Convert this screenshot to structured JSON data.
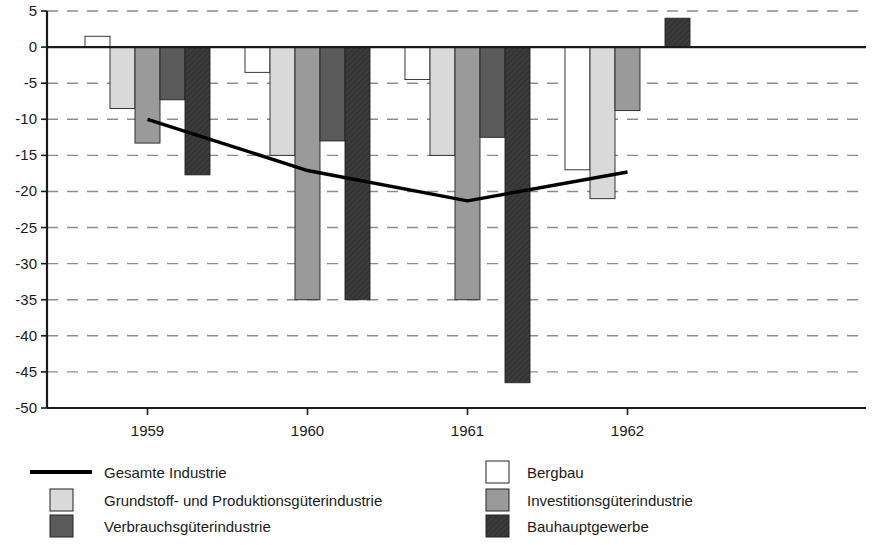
{
  "chart_data": {
    "type": "bar",
    "title": "",
    "xlabel": "",
    "ylabel": "",
    "categories": [
      "1959",
      "1960",
      "1961",
      "1962"
    ],
    "ylim": [
      -50,
      5
    ],
    "yticks": [
      5,
      0,
      -5,
      -10,
      -15,
      -20,
      -25,
      -30,
      -35,
      -40,
      -45,
      -50
    ],
    "ytick_labels": [
      "5",
      "0",
      "-5",
      "-10",
      "-15",
      "-20",
      "-25",
      "-30",
      "-35",
      "-40",
      "-45",
      "-50"
    ],
    "grid": true,
    "grid_style": "dashed",
    "legend_position": "bottom",
    "series": [
      {
        "name": "Bergbau",
        "kind": "bar",
        "color": "#ffffff",
        "stroke": "#222222",
        "values": [
          1.5,
          -3.5,
          -4.5,
          -17.0
        ]
      },
      {
        "name": "Grundstoff- und Produktionsgüterindustrie",
        "kind": "bar",
        "color": "#d9d9d9",
        "stroke": "#222222",
        "values": [
          -8.5,
          -15.0,
          -15.0,
          -21.0
        ]
      },
      {
        "name": "Investitionsgüterindustrie",
        "kind": "bar",
        "color": "#9a9a9a",
        "stroke": "#222222",
        "values": [
          -13.3,
          -35.0,
          -35.0,
          -8.8
        ]
      },
      {
        "name": "Verbrauchsgüterindustrie",
        "kind": "bar",
        "color": "#5a5a5a",
        "stroke": "#222222",
        "values": [
          -7.3,
          -13.0,
          -12.5,
          0.0
        ]
      },
      {
        "name": "Bauhauptgewerbe",
        "kind": "bar",
        "color": "#3b3b3b",
        "stroke": "#222222",
        "hatched": true,
        "values": [
          -17.7,
          -35.0,
          -46.5,
          4.0
        ]
      },
      {
        "name": "Gesamte Industrie",
        "kind": "line",
        "color": "#000000",
        "values": [
          -10.0,
          -17.1,
          -21.3,
          -17.3
        ]
      }
    ],
    "legend": [
      {
        "label": "Gesamte Industrie",
        "swatch": "line",
        "color": "#000000"
      },
      {
        "label": "Bergbau",
        "swatch": "box",
        "color": "#ffffff"
      },
      {
        "label": "Grundstoff- und Produktionsgüterindustrie",
        "swatch": "box",
        "color": "#d9d9d9"
      },
      {
        "label": "Investitionsgüterindustrie",
        "swatch": "box",
        "color": "#9a9a9a"
      },
      {
        "label": "Verbrauchsgüterindustrie",
        "swatch": "box",
        "color": "#5a5a5a"
      },
      {
        "label": "Bauhauptgewerbe",
        "swatch": "box",
        "color": "#3b3b3b"
      }
    ]
  },
  "axis": {
    "y_top_label": "5",
    "y_bottom_label": "-50",
    "zero_label": "0"
  },
  "colors": {
    "axis": "#1a1a1a",
    "grid": "#8c8c8c",
    "background": "#ffffff",
    "line_series": "#000000"
  }
}
